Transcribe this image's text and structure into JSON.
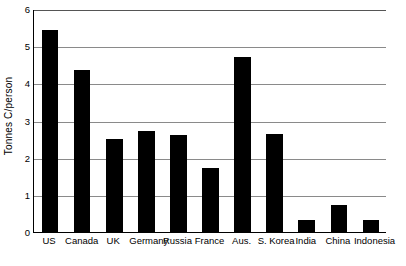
{
  "chart_data": {
    "type": "bar",
    "title": "",
    "xlabel": "",
    "ylabel": "Tonnes C/person",
    "ylim": [
      0,
      6
    ],
    "ytick_labels": [
      "0",
      "1",
      "2",
      "3",
      "4",
      "5",
      "6"
    ],
    "ytick_values": [
      0,
      1,
      2,
      3,
      4,
      5,
      6
    ],
    "grid": true,
    "legend": "none",
    "bar_color": "#000000",
    "categories": [
      "US",
      "Canada",
      "UK",
      "Germany",
      "Russia",
      "France",
      "Aus.",
      "S. Korea",
      "India",
      "China",
      "Indonesia"
    ],
    "values": [
      5.43,
      4.35,
      2.5,
      2.73,
      2.6,
      1.72,
      4.72,
      2.65,
      0.32,
      0.72,
      0.33
    ]
  },
  "axis": {
    "y_title": "Tonnes C/person"
  }
}
